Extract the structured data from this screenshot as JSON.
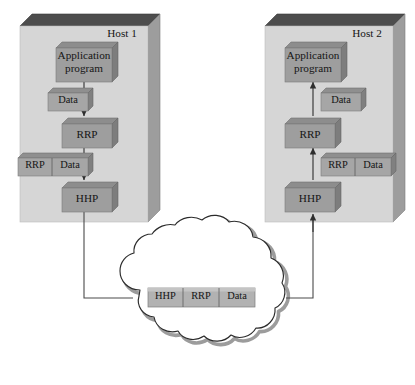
{
  "diagram": {
    "colors": {
      "panel_face": "#d4d4d4",
      "panel_top_bevel": "#4a4a4a",
      "panel_right_bevel": "#9a9a9a",
      "box_face": "#9e9e9e",
      "box_top": "#8a8a8a",
      "box_side": "#7d7d7d",
      "flat_box_face": "#a8a8a8",
      "flat_box_top": "#8f8f8f",
      "packet_face": "#b0b0b0",
      "line": "#3a3a3a",
      "cloud_stroke": "#2b2b2b",
      "cloud_fill": "#ffffff",
      "text": "#151515"
    },
    "hosts": [
      {
        "id": "host-1",
        "label": "Host 1",
        "direction": "send",
        "layers": [
          {
            "name": "application-program",
            "label_line1": "Application",
            "label_line2": "program"
          },
          {
            "name": "rrp",
            "label_line1": "RRP",
            "label_line2": ""
          },
          {
            "name": "hhp",
            "label_line1": "HHP",
            "label_line2": ""
          }
        ],
        "pdus": [
          {
            "name": "data-pdu",
            "fields": [
              "Data"
            ]
          },
          {
            "name": "rrp-data-pdu",
            "fields": [
              "RRP",
              "Data"
            ]
          }
        ]
      },
      {
        "id": "host-2",
        "label": "Host 2",
        "direction": "receive",
        "layers": [
          {
            "name": "application-program",
            "label_line1": "Application",
            "label_line2": "program"
          },
          {
            "name": "rrp",
            "label_line1": "RRP",
            "label_line2": ""
          },
          {
            "name": "hhp",
            "label_line1": "HHP",
            "label_line2": ""
          }
        ],
        "pdus": [
          {
            "name": "data-pdu",
            "fields": [
              "Data"
            ]
          },
          {
            "name": "rrp-data-pdu",
            "fields": [
              "RRP",
              "Data"
            ]
          }
        ]
      }
    ],
    "cloud": {
      "name": "network-cloud",
      "packet": {
        "name": "network-packet",
        "fields": [
          "HHP",
          "RRP",
          "Data"
        ]
      }
    }
  }
}
